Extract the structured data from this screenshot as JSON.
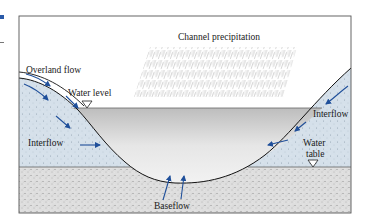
{
  "diagram": {
    "title_label": "Channel precipitation",
    "labels": {
      "overland_flow": "Overland flow",
      "water_level": "Water level",
      "interflow_left": "Interflow",
      "interflow_right": "Interflow",
      "water_table_line1": "Water",
      "water_table_line2": "table",
      "baseflow": "Baseflow"
    },
    "colors": {
      "frame": "#555555",
      "arrow": "#1f4f9a",
      "soil_unsaturated": "#d6e1ea",
      "soil_saturated": "#dcdcdc",
      "channel_water": "#c9c9c9",
      "bank_line": "#111111",
      "rain": "#9a9a9a"
    },
    "symbols": {
      "water_level_marker": "inverted-triangle",
      "water_table_marker": "inverted-triangle"
    }
  }
}
